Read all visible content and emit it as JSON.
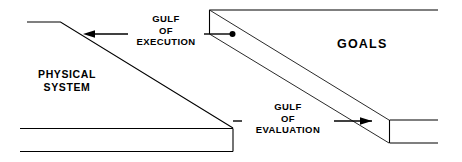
{
  "diagram": {
    "labels": {
      "gulf_execution": {
        "line1": "GULF",
        "line2": "OF",
        "line3": "EXECUTION"
      },
      "gulf_evaluation": {
        "line1": "GULF",
        "line2": "OF",
        "line3": "EVALUATION"
      },
      "goals": "GOALS",
      "physical_system": {
        "line1": "PHYSICAL",
        "line2": "SYSTEM"
      }
    },
    "colors": {
      "stroke": "#000000",
      "stroke_light": "#2a2a2a",
      "background": "#ffffff",
      "text": "#000000"
    },
    "arrows": {
      "execution": {
        "direction": "left",
        "from_x": 233,
        "from_y": 34,
        "to_x": 83,
        "to_y": 34,
        "endpoint_marker": "dot"
      },
      "evaluation": {
        "direction": "right",
        "from_x": 233,
        "from_y": 121,
        "to_x": 372,
        "to_y": 121,
        "endpoint_marker": "arrowhead"
      }
    }
  }
}
